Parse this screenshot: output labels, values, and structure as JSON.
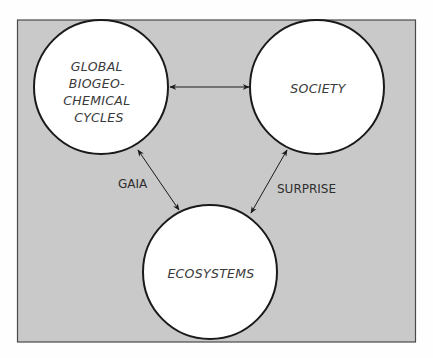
{
  "diagram": {
    "background_color": "#c9c9c9",
    "node_fill": "#ffffff",
    "stroke_color": "#1a1a1a",
    "nodes": [
      {
        "id": "global-biogeochemical-cycles",
        "lines": [
          "GLOBAL",
          "BIOGEO-",
          "CHEMICAL",
          "CYCLES"
        ]
      },
      {
        "id": "society",
        "lines": [
          "SOCIETY"
        ]
      },
      {
        "id": "ecosystems",
        "lines": [
          "ECOSYSTEMS"
        ]
      }
    ],
    "edges": [
      {
        "from": "global-biogeochemical-cycles",
        "to": "society",
        "label": "",
        "direction": "bidirectional"
      },
      {
        "from": "global-biogeochemical-cycles",
        "to": "ecosystems",
        "label": "GAIA",
        "direction": "bidirectional"
      },
      {
        "from": "society",
        "to": "ecosystems",
        "label": "SURPRISE",
        "direction": "bidirectional"
      }
    ]
  }
}
